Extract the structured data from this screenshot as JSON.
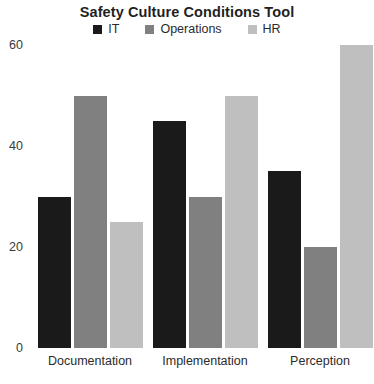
{
  "chart_data": {
    "type": "bar",
    "title": "Safety Culture Conditions Tool",
    "xlabel": "",
    "ylabel": "",
    "categories": [
      "Documentation",
      "Implementation",
      "Perception"
    ],
    "series": [
      {
        "name": "IT",
        "color": "#1a1a1a",
        "values": [
          30,
          45,
          35
        ]
      },
      {
        "name": "Operations",
        "color": "#808080",
        "values": [
          50,
          30,
          20
        ]
      },
      {
        "name": "HR",
        "color": "#bfbfbf",
        "values": [
          25,
          50,
          60
        ]
      }
    ],
    "yticks": [
      0,
      20,
      40,
      60
    ],
    "ylim": [
      0,
      60
    ],
    "grid": false,
    "legend_position": "top-center"
  }
}
